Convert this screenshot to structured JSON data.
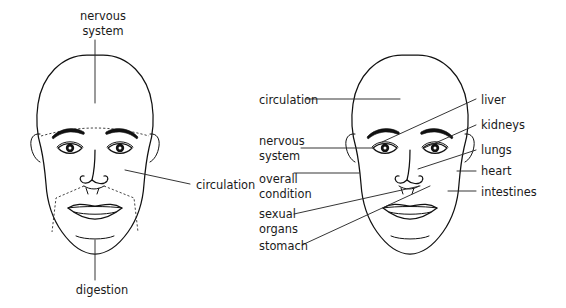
{
  "diagram": {
    "background_color": "#ffffff",
    "ink_color": "#111111",
    "label_color": "#1a1a1a"
  },
  "left_face": {
    "name": "left-face-diagram",
    "labels": [
      {
        "id": "nervous-system",
        "text_line1": "nervous",
        "text_line2": "system",
        "position": "top-center",
        "x": 103,
        "y": 12
      },
      {
        "id": "circulation",
        "text_line1": "circulation",
        "text_line2": "",
        "position": "right-middle",
        "x": 196,
        "y": 184
      },
      {
        "id": "digestion",
        "text_line1": "digestion",
        "text_line2": "",
        "position": "bottom-center",
        "x": 102,
        "y": 288
      }
    ]
  },
  "right_face": {
    "name": "right-face-diagram",
    "left_labels": [
      {
        "id": "circulation",
        "text_line1": "circulation",
        "text_line2": "",
        "x": 259,
        "y": 99
      },
      {
        "id": "nervous-system",
        "text_line1": "nervous",
        "text_line2": "system",
        "x": 259,
        "y": 141
      },
      {
        "id": "overall-condition",
        "text_line1": "overall",
        "text_line2": "condition",
        "x": 259,
        "y": 180
      },
      {
        "id": "sexual-organs",
        "text_line1": "sexual",
        "text_line2": "organs",
        "x": 259,
        "y": 213
      },
      {
        "id": "stomach",
        "text_line1": "stomach",
        "text_line2": "",
        "x": 259,
        "y": 245
      }
    ],
    "right_labels": [
      {
        "id": "liver",
        "text_line1": "liver",
        "text_line2": "",
        "x": 481,
        "y": 99
      },
      {
        "id": "kidneys",
        "text_line1": "kidneys",
        "text_line2": "",
        "x": 481,
        "y": 125
      },
      {
        "id": "lungs",
        "text_line1": "lungs",
        "text_line2": "",
        "x": 481,
        "y": 150
      },
      {
        "id": "heart",
        "text_line1": "heart",
        "text_line2": "",
        "x": 481,
        "y": 171
      },
      {
        "id": "intestines",
        "text_line1": "intestines",
        "text_line2": "",
        "x": 481,
        "y": 191
      }
    ]
  }
}
